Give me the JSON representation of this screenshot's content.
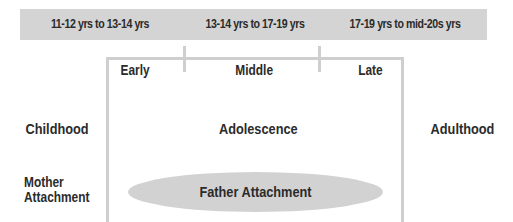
{
  "age_ranges": [
    {
      "label": "11-12 yrs to 13-14 yrs"
    },
    {
      "label": "13-14 yrs to 17-19 yrs"
    },
    {
      "label": "17-19 yrs to mid-20s yrs"
    }
  ],
  "stages": [
    {
      "label": "Early"
    },
    {
      "label": "Middle"
    },
    {
      "label": "Late"
    }
  ],
  "periods": {
    "childhood": "Childhood",
    "adolescence": "Adolescence",
    "adulthood": "Adulthood"
  },
  "attachments": {
    "mother_line1": "Mother",
    "mother_line2": "Attachment",
    "father": "Father Attachment"
  },
  "colors": {
    "bar": "#d4d4d4",
    "box_border": "#cfcfcf",
    "ellipse": "#d2d2d2",
    "text": "#2b2b2b"
  }
}
